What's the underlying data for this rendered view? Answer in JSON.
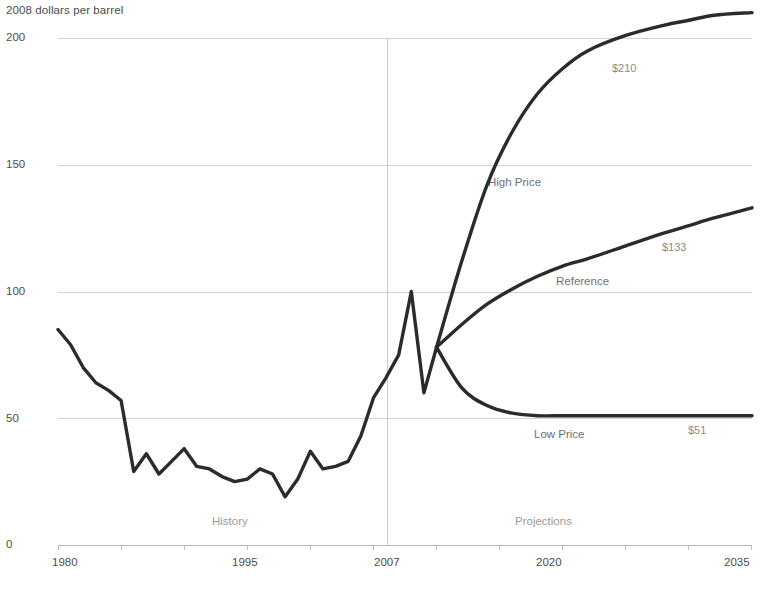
{
  "chart_data": {
    "type": "line",
    "title": "",
    "ylabel": "2008 dollars per barrel",
    "xlabel": "",
    "ylim": [
      0,
      200
    ],
    "xlim": [
      1980,
      2035
    ],
    "yticks": [
      "0",
      "50",
      "100",
      "150",
      "200"
    ],
    "ytick_values": [
      0,
      50,
      100,
      150,
      200
    ],
    "xticks": [
      "1980",
      "1995",
      "2007",
      "2020",
      "2035"
    ],
    "xtick_values": [
      1980,
      1995,
      2007,
      2020,
      2035
    ],
    "grid": "horizontal",
    "legend": "inline-labels",
    "annotations": {
      "history": "History",
      "projections": "Projections",
      "divider_year": 2007
    },
    "series": [
      {
        "name": "History",
        "end_label": "",
        "x": [
          1980,
          1981,
          1982,
          1983,
          1984,
          1985,
          1986,
          1987,
          1988,
          1989,
          1990,
          1991,
          1992,
          1993,
          1994,
          1995,
          1996,
          1997,
          1998,
          1999,
          2000,
          2001,
          2002,
          2003,
          2004,
          2005,
          2006,
          2007,
          2008,
          2009,
          2010
        ],
        "values": [
          85,
          79,
          70,
          64,
          61,
          57,
          29,
          36,
          28,
          33,
          38,
          31,
          30,
          27,
          25,
          26,
          30,
          28,
          19,
          26,
          37,
          30,
          31,
          33,
          43,
          58,
          66,
          75,
          100,
          60,
          78
        ]
      },
      {
        "name": "High Price",
        "end_label": "$210",
        "x": [
          2010,
          2012,
          2014,
          2016,
          2018,
          2020,
          2022,
          2025,
          2028,
          2030,
          2032,
          2035
        ],
        "values": [
          78,
          112,
          142,
          163,
          178,
          188,
          195,
          201,
          205,
          207,
          209,
          210
        ]
      },
      {
        "name": "Reference",
        "end_label": "$133",
        "x": [
          2010,
          2012,
          2014,
          2016,
          2018,
          2020,
          2022,
          2025,
          2028,
          2030,
          2032,
          2035
        ],
        "values": [
          78,
          87,
          95,
          101,
          106,
          110,
          113,
          118,
          123,
          126,
          129,
          133
        ]
      },
      {
        "name": "Low Price",
        "end_label": "$51",
        "x": [
          2010,
          2012,
          2014,
          2016,
          2018,
          2020,
          2022,
          2025,
          2028,
          2030,
          2032,
          2035
        ],
        "values": [
          78,
          62,
          55,
          52,
          51,
          51,
          51,
          51,
          51,
          51,
          51,
          51
        ]
      }
    ]
  },
  "labels": {
    "axis_title": "2008 dollars per barrel",
    "y0": "0",
    "y50": "50",
    "y100": "100",
    "y150": "150",
    "y200": "200",
    "x1980": "1980",
    "x1995": "1995",
    "x2007": "2007",
    "x2020": "2020",
    "x2035": "2035",
    "history": "History",
    "projections": "Projections",
    "high_price": "High Price",
    "reference": "Reference",
    "low_price": "Low Price",
    "high_price_value": "$210",
    "reference_value": "$133",
    "low_price_value": "$51"
  },
  "colors": {
    "line": "#2b2b2b",
    "grid": "#d2d2d2",
    "text": "#4d4d4d",
    "muted_text": "#9a9a9a",
    "background": "#ffffff"
  }
}
